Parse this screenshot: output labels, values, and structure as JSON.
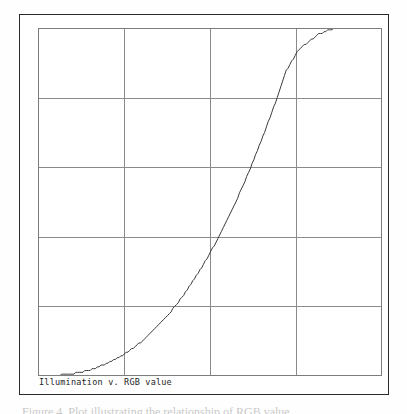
{
  "figure": {
    "caption_inside_plot": "Illumination v. RGB value",
    "below_frame_clipped_text": "Figure 4.  Plot illustrating the relationship of RGB value",
    "frame_color": "#2b2b2b",
    "grid_color": "#8a8a8a",
    "curve_color": "#3a3a3a",
    "background_color": "#ffffff"
  },
  "chart_data": {
    "type": "line",
    "title": "Illumination v. RGB value",
    "xlabel": "",
    "ylabel": "",
    "xlim": [
      0,
      255
    ],
    "ylim": [
      0,
      1
    ],
    "grid": true,
    "grid_columns": 4,
    "grid_rows": 5,
    "x_gridline_values": [
      0,
      63.75,
      127.5,
      191.25,
      255
    ],
    "y_gridline_values": [
      0,
      0.2,
      0.4,
      0.6,
      0.8,
      1.0
    ],
    "legend": "none",
    "axis_tick_labels": "none",
    "annotation": "Curve is gamma-like (approximately y = (x/255)^2.4), rising slowly from the origin and steeply near the right, exiting the top of the panel before the right edge.",
    "series": [
      {
        "name": "Illumination",
        "x": [
          0,
          8,
          16,
          24,
          32,
          40,
          48,
          56,
          64,
          72,
          80,
          88,
          96,
          104,
          112,
          120,
          128,
          136,
          144,
          152,
          160,
          168,
          176,
          184,
          192,
          200,
          208,
          216,
          222
        ],
        "y": [
          0.0,
          0.0005,
          0.0022,
          0.0058,
          0.0115,
          0.0197,
          0.0308,
          0.0452,
          0.063,
          0.0845,
          0.11,
          0.1397,
          0.1737,
          0.2122,
          0.2555,
          0.3035,
          0.3566,
          0.4148,
          0.4782,
          0.547,
          0.6212,
          0.701,
          0.7865,
          0.8777,
          0.93,
          0.96,
          0.982,
          0.995,
          1.0
        ]
      }
    ]
  }
}
